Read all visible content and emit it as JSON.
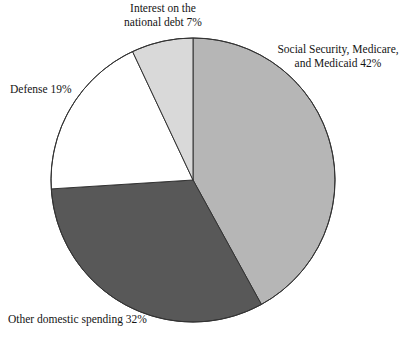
{
  "figure": {
    "background_color": "#ffffff",
    "width": 410,
    "height": 343
  },
  "chart_data": {
    "type": "pie",
    "title": "",
    "subtitle": "",
    "xlabel": "",
    "ylabel": "",
    "grid": false,
    "legend_position": "none",
    "label_style": "outside-callout",
    "start_angle_deg": 0,
    "direction": "clockwise",
    "center": [
      193,
      180
    ],
    "radius": 142,
    "outline_color": "#333333",
    "categories": [
      "Social Security, Medicare, and Medicaid",
      "Other domestic spending",
      "Defense",
      "Interest on the national debt"
    ],
    "values": [
      42,
      32,
      19,
      7
    ],
    "units": "percent",
    "colors": [
      "#b6b6b6",
      "#585858",
      "#ffffff",
      "#d9d9d9"
    ],
    "slices": [
      {
        "name": "Social Security, Medicare, and Medicaid",
        "value": 42,
        "value_label": "42%",
        "color": "#b6b6b6",
        "start_angle_deg": 0,
        "end_angle_deg": 151.2
      },
      {
        "name": "Other domestic spending",
        "value": 32,
        "value_label": "32%",
        "color": "#585858",
        "start_angle_deg": 151.2,
        "end_angle_deg": 266.4
      },
      {
        "name": "Defense",
        "value": 19,
        "value_label": "19%",
        "color": "#ffffff",
        "start_angle_deg": 266.4,
        "end_angle_deg": 334.8
      },
      {
        "name": "Interest on the national debt",
        "value": 7,
        "value_label": "7%",
        "color": "#d9d9d9",
        "start_angle_deg": 334.8,
        "end_angle_deg": 360
      }
    ]
  },
  "labels": {
    "interest": "Interest on the\nnational debt 7%",
    "social_security": "Social Security, Medicare,\nand Medicaid 42%",
    "defense": "Defense 19%",
    "other_domestic": "Other domestic spending 32%"
  }
}
